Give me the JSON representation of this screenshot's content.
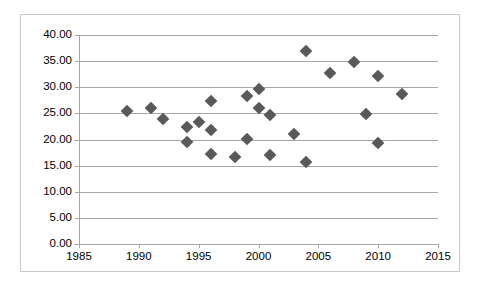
{
  "chart_data": {
    "type": "scatter",
    "title": "",
    "subtitle": "",
    "xlabel": "",
    "ylabel": "",
    "xlim": [
      1985,
      2015
    ],
    "ylim": [
      0.0,
      40.0
    ],
    "xticks": [
      1985,
      1990,
      1995,
      2000,
      2005,
      2010,
      2015
    ],
    "xtick_labels": [
      "1985",
      "1990",
      "1995",
      "2000",
      "2005",
      "2010",
      "2015"
    ],
    "yticks": [
      0.0,
      5.0,
      10.0,
      15.0,
      20.0,
      25.0,
      30.0,
      35.0,
      40.0
    ],
    "ytick_labels": [
      "0.00",
      "5.00",
      "10.00",
      "15.00",
      "20.00",
      "25.00",
      "30.00",
      "35.00",
      "40.00"
    ],
    "grid": "horizontal",
    "legend": "none",
    "marker": "diamond",
    "marker_color": "#595959",
    "gridline_color": "#a6a6a6",
    "border_color": "#c8c8c8",
    "background_color": "#ffffff",
    "series": [
      {
        "name": "Series 1",
        "points": [
          {
            "x": 1989,
            "y": 25.4
          },
          {
            "x": 1991,
            "y": 26.0
          },
          {
            "x": 1992,
            "y": 23.9
          },
          {
            "x": 1994,
            "y": 22.4
          },
          {
            "x": 1994,
            "y": 19.6
          },
          {
            "x": 1995,
            "y": 23.4
          },
          {
            "x": 1996,
            "y": 27.4
          },
          {
            "x": 1996,
            "y": 21.9
          },
          {
            "x": 1996,
            "y": 17.3
          },
          {
            "x": 1998,
            "y": 16.6
          },
          {
            "x": 1999,
            "y": 28.4
          },
          {
            "x": 1999,
            "y": 20.1
          },
          {
            "x": 2000,
            "y": 29.7
          },
          {
            "x": 2000,
            "y": 26.0
          },
          {
            "x": 2001,
            "y": 24.7
          },
          {
            "x": 2001,
            "y": 17.0
          },
          {
            "x": 2003,
            "y": 21.0
          },
          {
            "x": 2004,
            "y": 37.0
          },
          {
            "x": 2004,
            "y": 15.6
          },
          {
            "x": 2006,
            "y": 32.8
          },
          {
            "x": 2008,
            "y": 34.8
          },
          {
            "x": 2009,
            "y": 24.9
          },
          {
            "x": 2010,
            "y": 32.1
          },
          {
            "x": 2010,
            "y": 19.4
          },
          {
            "x": 2012,
            "y": 28.8
          }
        ]
      }
    ]
  }
}
